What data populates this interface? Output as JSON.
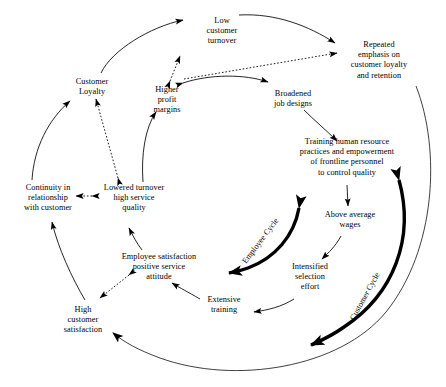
{
  "diagram": {
    "type": "causal-loop-diagram",
    "colors": {
      "ink": "#000000",
      "background": "#ffffff"
    },
    "nodes": [
      {
        "id": "low-customer-turnover",
        "label": "Low\ncustomer\nturnover",
        "x": 191,
        "y": 16,
        "w": 62
      },
      {
        "id": "repeated-emphasis",
        "label": "Repeated\nemphasis on\ncustomer loyalty\nand retention",
        "x": 333,
        "y": 40,
        "w": 92
      },
      {
        "id": "customer-loyalty",
        "label": "Customer\nLoyalty",
        "x": 62,
        "y": 77,
        "w": 60
      },
      {
        "id": "higher-profit-margins",
        "label": "Higher\nprofit\nmargins",
        "x": 143,
        "y": 85,
        "w": 48
      },
      {
        "id": "broadened-job-designs",
        "label": "Broadened\njob designs",
        "x": 262,
        "y": 89,
        "w": 62
      },
      {
        "id": "training-human-resource",
        "label": "Training human resource\npractices and empowerment\nof frontline personnel\nto control quality",
        "x": 291,
        "y": 137,
        "w": 112
      },
      {
        "id": "continuity-in-relationship",
        "label": "Continuity in\nrelationship\nwith customer",
        "x": 10,
        "y": 183,
        "w": 76
      },
      {
        "id": "lowered-turnover",
        "label": "Lowered turnover\nhigh service\nquality",
        "x": 96,
        "y": 183,
        "w": 76
      },
      {
        "id": "above-average-wages",
        "label": "Above average\nwages",
        "x": 314,
        "y": 210,
        "w": 72
      },
      {
        "id": "employee-satisfaction",
        "label": "Employee satisfaction\npositive service\nattitude",
        "x": 104,
        "y": 252,
        "w": 110
      },
      {
        "id": "intensified-selection-effort",
        "label": "Intensified\nselection\neffort",
        "x": 282,
        "y": 262,
        "w": 56
      },
      {
        "id": "extensive-training",
        "label": "Extensive\ntraining",
        "x": 196,
        "y": 295,
        "w": 56
      },
      {
        "id": "high-customer-satisfaction",
        "label": "High\ncustomer\nsatisfaction",
        "x": 52,
        "y": 305,
        "w": 62
      }
    ],
    "cycle_labels": [
      {
        "id": "employee-cycle",
        "label": "Employee Cycle",
        "x": 244,
        "y": 258,
        "rotate": -53
      },
      {
        "id": "customer-cycle",
        "label": "Customer Cycle",
        "x": 352,
        "y": 315,
        "rotate": -61
      }
    ],
    "edges": [
      {
        "from": "customer-loyalty-arc",
        "to": "low-customer-turnover",
        "style": "solid"
      },
      {
        "from": "low-customer-turnover",
        "to": "repeated-emphasis",
        "style": "solid"
      },
      {
        "from": "higher-profit-margins",
        "to": "low-customer-turnover",
        "style": "dotted",
        "bidirectional": true
      },
      {
        "from": "higher-profit-margins",
        "to": "broadened-job-designs",
        "style": "solid",
        "bidirectional": true
      },
      {
        "from": "higher-profit-margins",
        "to": "repeated-emphasis",
        "style": "dotted"
      },
      {
        "from": "broadened-job-designs",
        "to": "training-human-resource",
        "style": "solid"
      },
      {
        "from": "training-human-resource",
        "to": "above-average-wages",
        "style": "solid"
      },
      {
        "from": "above-average-wages",
        "to": "intensified-selection-effort",
        "style": "solid"
      },
      {
        "from": "intensified-selection-effort",
        "to": "extensive-training",
        "style": "solid"
      },
      {
        "from": "extensive-training",
        "to": "employee-satisfaction",
        "style": "solid"
      },
      {
        "from": "employee-satisfaction",
        "to": "lowered-turnover",
        "style": "solid"
      },
      {
        "from": "employee-satisfaction",
        "to": "high-customer-satisfaction",
        "style": "dotted",
        "bidirectional": true
      },
      {
        "from": "lowered-turnover",
        "to": "customer-loyalty",
        "style": "dotted",
        "bidirectional": true
      },
      {
        "from": "lowered-turnover",
        "to": "continuity-in-relationship",
        "style": "dotted",
        "bidirectional": true
      },
      {
        "from": "lowered-turnover",
        "to": "higher-profit-margins",
        "style": "solid"
      },
      {
        "from": "high-customer-satisfaction",
        "to": "continuity-in-relationship",
        "style": "solid"
      },
      {
        "from": "continuity-in-relationship",
        "to": "customer-loyalty",
        "style": "solid"
      },
      {
        "from": "repeated-emphasis",
        "to": "high-customer-satisfaction",
        "style": "solid",
        "note": "thin outer arc"
      },
      {
        "from": "employee-cycle-arc",
        "to": "both",
        "style": "thick",
        "bidirectional": true
      },
      {
        "from": "customer-cycle-arc",
        "to": "both",
        "style": "thick",
        "bidirectional": true
      }
    ]
  }
}
